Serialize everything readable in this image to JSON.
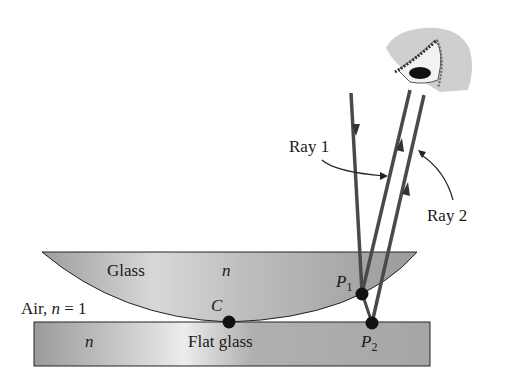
{
  "diagram": {
    "labels": {
      "glass": "Glass",
      "lens_n": "n",
      "air": "Air, ",
      "air_n": "n",
      "air_eq": " = 1",
      "flat_n": "n",
      "flat_glass": "Flat glass",
      "point_c": "C",
      "point_p1": "P",
      "point_p1_sub": "1",
      "point_p2": "P",
      "point_p2_sub": "2",
      "ray1": "Ray 1",
      "ray2": "Ray 2"
    },
    "colors": {
      "ray": "#4a4a4a",
      "glass_fill": "#b8b8b8",
      "glass_highlight": "#e6e6e6",
      "outline": "#222222",
      "point": "#111111",
      "eye_skin": "#cfcfcf"
    }
  }
}
